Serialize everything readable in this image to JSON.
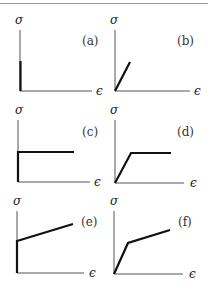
{
  "figure": {
    "y_axis_symbol": "σ",
    "x_axis_symbol": "ϵ",
    "panels": [
      {
        "id": "a",
        "label": "(a)",
        "description": "rigid: vertical line along stress axis"
      },
      {
        "id": "b",
        "label": "(b)",
        "description": "linear elastic"
      },
      {
        "id": "c",
        "label": "(c)",
        "description": "rigid perfectly plastic"
      },
      {
        "id": "d",
        "label": "(d)",
        "description": "elastic perfectly plastic"
      },
      {
        "id": "e",
        "label": "(e)",
        "description": "rigid linear hardening"
      },
      {
        "id": "f",
        "label": "(f)",
        "description": "elastic linear hardening"
      }
    ]
  },
  "colors": {
    "axis": "#555555",
    "curve": "#111111",
    "rule": "#9a9a9a"
  }
}
